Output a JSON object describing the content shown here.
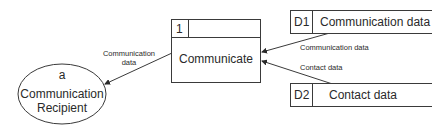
{
  "process": {
    "id": "1",
    "label": "Communicate"
  },
  "external_entity": {
    "id": "a",
    "label_line1": "Communication",
    "label_line2": "Recipient"
  },
  "data_stores": [
    {
      "id": "D1",
      "label": "Communication data"
    },
    {
      "id": "D2",
      "label": "Contact data"
    }
  ],
  "flows": [
    {
      "from": "D1",
      "to": "1",
      "label": "Communication data"
    },
    {
      "from": "D2",
      "to": "1",
      "label": "Contact data"
    },
    {
      "from": "1",
      "to": "a",
      "label_line1": "Communication",
      "label_line2": "data"
    }
  ],
  "colors": {
    "stroke": "#3a3a3a",
    "text": "#2a2a2a",
    "background": "#ffffff"
  }
}
